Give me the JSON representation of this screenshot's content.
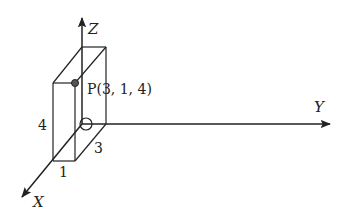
{
  "diagram": {
    "type": "3d-coordinate-system",
    "axes": {
      "x_label": "X",
      "y_label": "Y",
      "z_label": "Z"
    },
    "point": {
      "label": "P(3, 1, 4)",
      "coords": [
        3,
        1,
        4
      ]
    },
    "box": {
      "dim_height": "4",
      "dim_x": "1",
      "dim_y": "3"
    },
    "colors": {
      "stroke": "#222222",
      "background": "#ffffff"
    }
  }
}
